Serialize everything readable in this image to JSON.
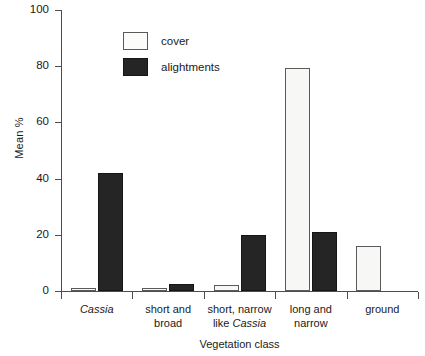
{
  "chart_data": {
    "type": "bar",
    "title": "",
    "subtitle": "",
    "xlabel": "Vegetation class",
    "ylabel": "Mean %",
    "ylim": [
      0,
      100
    ],
    "yticks": [
      0,
      20,
      40,
      60,
      80,
      100
    ],
    "ytick_labels": [
      "0",
      "20",
      "40",
      "60",
      "80",
      "100"
    ],
    "grid": false,
    "legend_position": "upper-left-inside",
    "categories": [
      "Cassia",
      "short and broad",
      "short, narrow like Cassia",
      "long and narrow",
      "ground"
    ],
    "category_lines": [
      [
        "Cassia"
      ],
      [
        "short and",
        "broad"
      ],
      [
        "short, narrow",
        "like Cassia"
      ],
      [
        "long and",
        "narrow"
      ],
      [
        "ground"
      ]
    ],
    "category_italic_words": [
      "Cassia"
    ],
    "series": [
      {
        "name": "cover",
        "color": "#f7f7f5",
        "values": [
          1,
          1,
          2,
          79.5,
          16
        ]
      },
      {
        "name": "alightments",
        "color": "#252525",
        "values": [
          42,
          2.5,
          20,
          21,
          0
        ]
      }
    ]
  },
  "legend": {
    "items": [
      {
        "label": "cover",
        "swatch": "cover"
      },
      {
        "label": "alightments",
        "swatch": "alightments"
      }
    ]
  },
  "axes": {
    "y_title": "Mean %",
    "x_title": "Vegetation class"
  }
}
